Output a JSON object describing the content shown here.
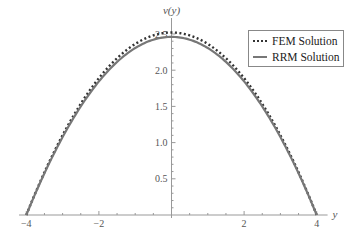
{
  "chart_data": {
    "type": "line",
    "title": "",
    "xlabel": "y",
    "ylabel": "v(y)",
    "xlim": [
      -4.2,
      4.3
    ],
    "ylim": [
      0,
      2.6
    ],
    "x_ticks": [
      -4,
      -2,
      2,
      4
    ],
    "x_tick_labels": [
      "-4",
      "-2",
      "2",
      "4"
    ],
    "y_ticks": [
      0.5,
      1.0,
      1.5,
      2.0,
      2.5
    ],
    "y_tick_labels": [
      "0.5",
      "1.0",
      "1.5",
      "2.0",
      "2.5"
    ],
    "grid": false,
    "legend_position": "upper right",
    "x": [
      -4,
      -3.5,
      -3,
      -2.5,
      -2,
      -1.5,
      -1,
      -0.5,
      0,
      0.5,
      1,
      1.5,
      2,
      2.5,
      3,
      3.5,
      4
    ],
    "series": [
      {
        "name": "FEM Solution",
        "style": "dotted",
        "color": "#333333",
        "values": [
          0.0,
          0.59,
          1.1,
          1.54,
          1.89,
          2.17,
          2.36,
          2.48,
          2.52,
          2.48,
          2.36,
          2.17,
          1.89,
          1.54,
          1.1,
          0.59,
          0.0
        ]
      },
      {
        "name": "RRM Solution",
        "style": "solid",
        "color": "#777777",
        "values": [
          0.0,
          0.57,
          1.07,
          1.5,
          1.84,
          2.11,
          2.3,
          2.42,
          2.46,
          2.42,
          2.3,
          2.11,
          1.84,
          1.5,
          1.07,
          0.57,
          0.0
        ]
      }
    ]
  },
  "axes": {
    "x_label": "y",
    "y_label": "v(y)"
  },
  "legend": {
    "items": [
      {
        "label": "FEM Solution"
      },
      {
        "label": "RRM Solution"
      }
    ]
  }
}
